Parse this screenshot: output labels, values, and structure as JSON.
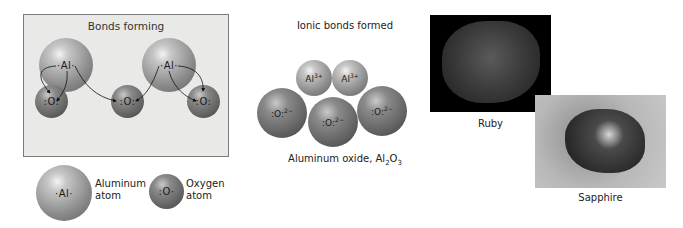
{
  "bonds_forming": {
    "title": "Bonds forming",
    "aluminum_symbol": "·Al·",
    "oxygen_symbol": ":O:"
  },
  "legend": {
    "aluminum_label_line1": "Aluminum",
    "aluminum_label_line2": "atom",
    "oxygen_label_line1": "Oxygen",
    "oxygen_label_line2": "atom",
    "aluminum_symbol": "·Al·",
    "oxygen_symbol": ":O·"
  },
  "ionic": {
    "title": "Ionic bonds formed",
    "al_ion": "Al",
    "al_charge": "3+",
    "o_ion": ":O:",
    "o_charge": "2−",
    "caption_main": "Aluminum oxide, Al",
    "caption_sub1": "2",
    "caption_mid": "O",
    "caption_sub2": "3"
  },
  "photos": {
    "ruby_caption": "Ruby",
    "sapphire_caption": "Sapphire"
  }
}
